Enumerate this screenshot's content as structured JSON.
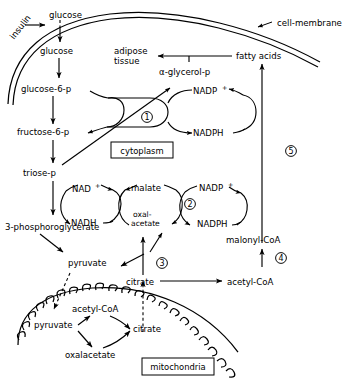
{
  "figure": {
    "type": "biochemical-pathway-diagram",
    "background_color": "#ffffff",
    "line_color": "#000000"
  },
  "compartments": [
    {
      "id": "cytoplasm",
      "label": "cytoplasm"
    },
    {
      "id": "mitochondria",
      "label": "mitochondria"
    }
  ],
  "membranes": [
    {
      "id": "cell-membrane",
      "label": "cell-membrane",
      "style": "double-line"
    },
    {
      "id": "mitochondrial-membrane",
      "label": "",
      "style": "scalloped"
    }
  ],
  "metabolites": {
    "insulin": "insulin",
    "glucose_outside": "glucose",
    "glucose_inside": "glucose",
    "glucose_6_p": "glucose-6-p",
    "fructose_6_p": "fructose-6-p",
    "triose_p": "triose-p",
    "phosphoglycerate": "3-phosphoroglycerate",
    "pyruvate_cyto": "pyruvate",
    "citrate_cyto": "citrate",
    "acetyl_coa_cyto": "acetyl-CoA",
    "malonyl_coa": "malonyl-CoA",
    "fatty_acids": "fatty acids",
    "adipose_tissue_line1": "adipose",
    "adipose_tissue_line2": "tissue",
    "alpha_glycerol_p": "α-glycerol-p",
    "pyruvate_mito": "pyruvate",
    "acetyl_coa_mito": "acetyl-CoA",
    "oxaloacetate_mito": "oxalacetate",
    "citrate_mito": "citrate",
    "malate": "malate",
    "oxalacetate_cyto_line1": "oxal-",
    "oxalacetate_cyto_line2": "acetate"
  },
  "cofactors": {
    "nadp_plus_top": "NADP",
    "nadp_plus_top_sup": "+",
    "nadph_top": "NADPH",
    "nad_plus": "NAD",
    "nad_plus_sup": "+",
    "nadh": "NADH",
    "nadp_plus_bottom": "NADP",
    "nadp_plus_bottom_sup": "+",
    "nadph_bottom": "NADPH"
  },
  "numbered_steps": [
    {
      "number": "1",
      "glyph": "①",
      "near": "glucose-6-p / fructose-6-p pentose shunt"
    },
    {
      "number": "2",
      "glyph": "②",
      "near": "malate / oxal-acetate NADP cycle"
    },
    {
      "number": "3",
      "glyph": "③",
      "near": "citrate to oxal-acetate"
    },
    {
      "number": "4",
      "glyph": "④",
      "near": "acetyl-CoA to malonyl-CoA"
    },
    {
      "number": "5",
      "glyph": "⑤",
      "near": "malonyl-CoA to fatty acids"
    }
  ]
}
